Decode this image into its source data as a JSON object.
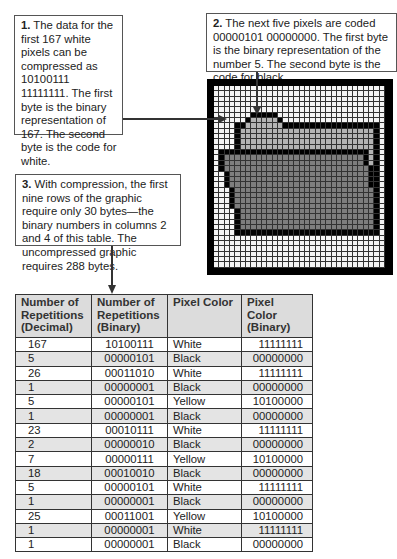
{
  "callouts": [
    {
      "number": "1.",
      "text": " The data for the first 167 white pixels can be compressed as 10100111 11111111. The first byte is the binary representation of 167. The second byte is the code for white."
    },
    {
      "number": "2.",
      "text": " The next five pixels are coded 00000101 00000000. The first byte is the binary representation of the number 5. The second byte is the code for black."
    },
    {
      "number": "3.",
      "text": " With compression, the first nine rows of the graphic require only 30 bytes—the binary numbers in columns 2 and 4 of this table. The uncompressed graphic requires 288 bytes."
    }
  ],
  "colors": {
    "white": "#f4f4f4",
    "black": "#000000",
    "yellow_gray": "#b4b4b4",
    "front_gray": "#7e7e7e",
    "header_bg": "#dcdcdc",
    "alt_row": "#e4e4e4"
  },
  "pixel_grid": {
    "columns": 32,
    "legend": {
      "W": "white",
      "B": "black",
      "Y": "yellow (light gray)",
      "D": "folder front (dark gray)"
    },
    "rows": [
      "WWWWWWWWWWWWWWWWWWWWWWWWWWWWWWWW",
      "WWWWWWWWWWWWWWWWWWWWWWWWWWWWWWWW",
      "WWWWWWWWWWWWWWWWWWWWWWWWWWWWWWWW",
      "WWWWWWWWWWWWWWWWWWWWWWWWWWWWWWWW",
      "WWWWWWWWWWWWWWWWWWWWWWWWWWWWWWWW",
      "WWWWWWWBBBBBWWWWWWWWWWWWWWWWWWWW",
      "WWWWWWBYYYYYBWWWWWWWWWWWWWWWWWWW",
      "WWWWBBYYYYYYYBBBBBBBBBBBBBBBBBBW",
      "WWWWBYYYYYYYYYYYYYYYYYYYYYYYYYBW",
      "WWWWBYYYYYYYYYYYYYYYYYYYYYYYYYBW",
      "WWWWBYYYYYYYYYYYYYYYYYYYYYYYYYBW",
      "WWWWBYYYYYYYYYYYYYYYYYYYYYYYYYBW",
      "WBBBBBBBBBBBBBBBBBBBBBBBBBBBBYBW",
      "WBDDDDDDDDDDDDDDDDDDDDDDDDDDBYBW",
      "WBDDDDDDDDDDDDDDDDDDDDDDDDDDBYBW",
      "WBDDDDDDDDDDDDDDDDDDDDDDDDDDDBBW",
      "WWBDDDDDDDDDDDDDDDDDDDDDDDDDDBBW",
      "WWBDDDDDDDDDDDDDDDDDDDDDDDDDDBBW",
      "WWBDDDDDDDDDDDDDDDDDDDDDDDDDDBBW",
      "WWWBDDDDDDDDDDDDDDDDDDDDDDDDDDBW",
      "WWWBDDDDDDDDDDDDDDDDDDDDDDDDDDBW",
      "WWWBDDDDDDDDDDDDDDDDDDDDDDDDDDBW",
      "WWWBDDDDDDDDDDDDDDDDDDDDDDDDDDBW",
      "WWWWBDDDDDDDDDDDDDDDDDDDDDDDDDBW",
      "WWWWBDDDDDDDDDDDDDDDDDDDDDDDDDBW",
      "WWWWBDDDDDDDDDDDDDDDDDDDDDDDDDBW",
      "WWWWBDDDDDDDDDDDDDDDDDDDDDDDDDBW",
      "WWWWBBBBBBBBBBBBBBBBBBBBBBBBBBBW",
      "WWWWWWWWWWWWWWWWWWWWWWWWWWWWWWWW",
      "WWWWWWWWWWWWWWWWWWWWWWWWWWWWWWWW",
      "WWWWWWWWWWWWWWWWWWWWWWWWWWWWWWWW",
      "WWWWWWWWWWWWWWWWWWWWWWWWWWWWWWWW",
      "WWWWWWWWWWWWWWWWWWWWWWWWWWWWWWWW",
      "WWWWWWWWWWWWWWWWWWWWWWWWWWWWWWWW"
    ]
  },
  "table": {
    "headers": [
      "Number of Repetitions (Decimal)",
      "Number of Repetitions (Binary)",
      "Pixel Color",
      "Pixel Color (Binary)"
    ],
    "rows": [
      [
        "167",
        "10100111",
        "White",
        "11111111"
      ],
      [
        "5",
        "00000101",
        "Black",
        "00000000"
      ],
      [
        "26",
        "00011010",
        "White",
        "11111111"
      ],
      [
        "1",
        "00000001",
        "Black",
        "00000000"
      ],
      [
        "5",
        "00000101",
        "Yellow",
        "10100000"
      ],
      [
        "1",
        "00000001",
        "Black",
        "00000000"
      ],
      [
        "23",
        "00010111",
        "White",
        "11111111"
      ],
      [
        "2",
        "00000010",
        "Black",
        "00000000"
      ],
      [
        "7",
        "00000111",
        "Yellow",
        "10100000"
      ],
      [
        "18",
        "00010010",
        "Black",
        "00000000"
      ],
      [
        "5",
        "00000101",
        "White",
        "11111111"
      ],
      [
        "1",
        "00000001",
        "Black",
        "00000000"
      ],
      [
        "25",
        "00011001",
        "Yellow",
        "10100000"
      ],
      [
        "1",
        "00000001",
        "White",
        "11111111"
      ],
      [
        "1",
        "00000001",
        "Black",
        "00000000"
      ]
    ]
  }
}
